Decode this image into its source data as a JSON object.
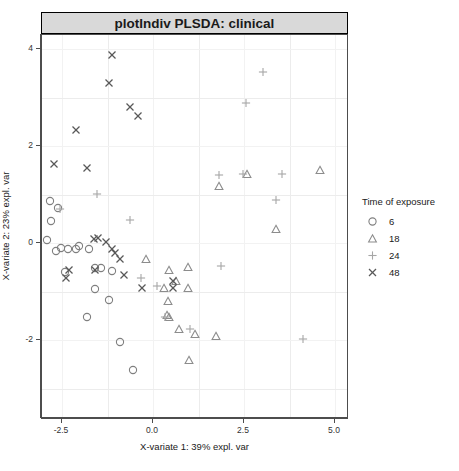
{
  "strip": {
    "title": "plotIndiv PLSDA: clinical"
  },
  "legend": {
    "title": "Time of exposure",
    "items": [
      {
        "label": "6",
        "shape": "circle-icon",
        "color": "#7f7f7f"
      },
      {
        "label": "18",
        "shape": "triangle-icon",
        "color": "#8c8c8c"
      },
      {
        "label": "24",
        "shape": "plus-icon",
        "color": "#a6a6a6"
      },
      {
        "label": "48",
        "shape": "cross-icon",
        "color": "#595959"
      }
    ]
  },
  "chart_data": {
    "type": "scatter",
    "title": "plotIndiv PLSDA: clinical",
    "xlabel": "X-variate 1: 39% expl. var",
    "ylabel": "X-variate 2: 23% expl. var",
    "xlim": [
      -3.2,
      5.6
    ],
    "ylim": [
      -3.0,
      4.3
    ],
    "xticks": [
      -2.5,
      0.0,
      2.5,
      5.0
    ],
    "xticklabels": [
      "-2.5",
      "0.0",
      "2.5",
      "5.0"
    ],
    "yticks": [
      -2,
      0,
      2,
      4
    ],
    "yticklabels": [
      "-2",
      "0",
      "2",
      "4"
    ],
    "grid": true,
    "legend_title": "Time of exposure",
    "legend_position": "right",
    "series": [
      {
        "name": "6",
        "shape": "circle",
        "color": "#7f7f7f",
        "points": [
          [
            -2.82,
            0.86
          ],
          [
            -2.62,
            0.72
          ],
          [
            -2.8,
            0.46
          ],
          [
            -2.92,
            0.07
          ],
          [
            -2.52,
            -0.1
          ],
          [
            -2.33,
            -0.12
          ],
          [
            -2.12,
            -0.13
          ],
          [
            -2.66,
            -0.17
          ],
          [
            -2.02,
            -0.07
          ],
          [
            -1.77,
            -0.12
          ],
          [
            -2.43,
            -0.6
          ],
          [
            -1.6,
            -0.52
          ],
          [
            -1.43,
            -0.52
          ],
          [
            -1.12,
            -0.58
          ],
          [
            -1.6,
            -0.95
          ],
          [
            -1.22,
            -1.18
          ],
          [
            -1.8,
            -1.52
          ],
          [
            -0.92,
            -2.05
          ],
          [
            -0.55,
            -2.62
          ]
        ]
      },
      {
        "name": "18",
        "shape": "triangle",
        "color": "#8c8c8c",
        "points": [
          [
            -0.18,
            -0.33
          ],
          [
            0.45,
            -0.55
          ],
          [
            0.95,
            -0.5
          ],
          [
            0.3,
            -0.93
          ],
          [
            0.95,
            -0.92
          ],
          [
            0.42,
            -1.2
          ],
          [
            0.38,
            -1.48
          ],
          [
            0.45,
            -1.52
          ],
          [
            0.72,
            -1.78
          ],
          [
            1.15,
            -1.88
          ],
          [
            1.72,
            -1.92
          ],
          [
            1.0,
            -2.42
          ],
          [
            1.82,
            1.18
          ],
          [
            2.58,
            1.42
          ],
          [
            3.38,
            0.28
          ],
          [
            4.58,
            1.5
          ],
          [
            0.62,
            -0.78
          ]
        ]
      },
      {
        "name": "24",
        "shape": "plus",
        "color": "#a6a6a6",
        "points": [
          [
            -2.55,
            0.7
          ],
          [
            -1.55,
            1.02
          ],
          [
            -0.62,
            0.48
          ],
          [
            -0.32,
            -0.72
          ],
          [
            0.12,
            -0.88
          ],
          [
            0.32,
            -1.52
          ],
          [
            1.02,
            -1.78
          ],
          [
            1.82,
            1.4
          ],
          [
            2.55,
            2.88
          ],
          [
            3.02,
            3.52
          ],
          [
            2.48,
            1.42
          ],
          [
            3.38,
            0.88
          ],
          [
            3.55,
            1.42
          ],
          [
            4.12,
            -1.98
          ],
          [
            1.88,
            -0.47
          ]
        ]
      },
      {
        "name": "48",
        "shape": "cross",
        "color": "#595959",
        "points": [
          [
            -2.72,
            1.62
          ],
          [
            -2.12,
            2.32
          ],
          [
            -1.8,
            1.55
          ],
          [
            -1.12,
            3.88
          ],
          [
            -1.22,
            3.3
          ],
          [
            -0.62,
            2.8
          ],
          [
            -0.42,
            2.62
          ],
          [
            -2.3,
            -0.55
          ],
          [
            -1.58,
            -0.55
          ],
          [
            -1.62,
            0.08
          ],
          [
            -1.52,
            0.1
          ],
          [
            -1.3,
            0.02
          ],
          [
            -1.12,
            -0.12
          ],
          [
            -1.05,
            -0.2
          ],
          [
            -0.92,
            -0.32
          ],
          [
            -2.4,
            -0.72
          ],
          [
            -0.8,
            -0.65
          ],
          [
            -0.3,
            -0.92
          ],
          [
            0.55,
            -0.92
          ],
          [
            0.55,
            -0.78
          ]
        ]
      }
    ]
  }
}
